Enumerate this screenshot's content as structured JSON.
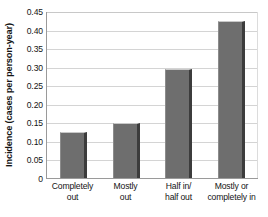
{
  "chart_data": {
    "type": "bar",
    "title": "",
    "subtitle": "",
    "xlabel": "",
    "ylabel": "Incidence (cases per person-year)",
    "categories": [
      "Completely out",
      "Mostly out",
      "Half in/ half out",
      "Mostly or completely in"
    ],
    "category_lines": [
      [
        "Completely",
        "out"
      ],
      [
        "Mostly",
        "out"
      ],
      [
        "Half in/",
        "half out"
      ],
      [
        "Mostly or",
        "completely in"
      ]
    ],
    "values": [
      0.125,
      0.147,
      0.295,
      0.422
    ],
    "ylim": [
      0,
      0.45
    ],
    "ytick_step": 0.05,
    "ytick_labels": [
      "0.45",
      "0.40",
      "0.35",
      "0.30",
      "0.25",
      "0.20",
      "0.15",
      "0.10",
      "0.05",
      "0"
    ],
    "ytick_values": [
      0.45,
      0.4,
      0.35,
      0.3,
      0.25,
      0.2,
      0.15,
      0.1,
      0.05,
      0
    ],
    "grid": true,
    "grid_orientation": "horizontal",
    "legend": null,
    "legend_position": "none",
    "bar_color": "#6e6e6e",
    "bar_highlight_color": "#c9c9c9",
    "bar_shadow_color": "#3c3c3c",
    "gridline_color": "#d4d4d4",
    "axis_color": "#9a9a9a",
    "background_color": "#ffffff",
    "text_color": "#141414"
  }
}
